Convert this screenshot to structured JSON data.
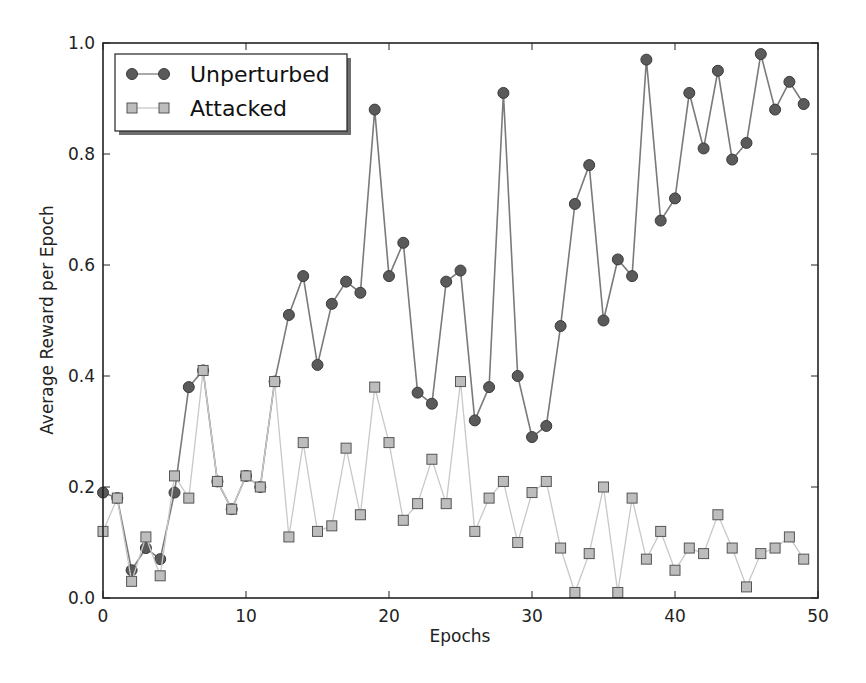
{
  "chart_data": {
    "type": "line",
    "title": "",
    "xlabel": "Epochs",
    "ylabel": "Average Reward per Epoch",
    "xlim": [
      0,
      50
    ],
    "ylim": [
      0.0,
      1.0
    ],
    "xticks": [
      "0",
      "10",
      "20",
      "30",
      "40",
      "50"
    ],
    "yticks": [
      "0.0",
      "0.2",
      "0.4",
      "0.6",
      "0.8",
      "1.0"
    ],
    "grid": false,
    "legend_position": "upper left",
    "x": [
      0,
      1,
      2,
      3,
      4,
      5,
      6,
      7,
      8,
      9,
      10,
      11,
      12,
      13,
      14,
      15,
      16,
      17,
      18,
      19,
      20,
      21,
      22,
      23,
      24,
      25,
      26,
      27,
      28,
      29,
      30,
      31,
      32,
      33,
      34,
      35,
      36,
      37,
      38,
      39,
      40,
      41,
      42,
      43,
      44,
      45,
      46,
      47,
      48,
      49
    ],
    "series": [
      {
        "name": "Unperturbed",
        "marker": "circle",
        "color": "#5a5a5a",
        "line_color": "#7a7a7a",
        "values": [
          0.19,
          0.18,
          0.05,
          0.09,
          0.07,
          0.19,
          0.38,
          0.41,
          0.21,
          0.16,
          0.22,
          0.2,
          0.39,
          0.51,
          0.58,
          0.42,
          0.53,
          0.57,
          0.55,
          0.88,
          0.58,
          0.64,
          0.37,
          0.35,
          0.57,
          0.59,
          0.32,
          0.38,
          0.91,
          0.4,
          0.29,
          0.31,
          0.49,
          0.71,
          0.78,
          0.5,
          0.61,
          0.58,
          0.97,
          0.68,
          0.72,
          0.91,
          0.81,
          0.95,
          0.79,
          0.82,
          0.98,
          0.88,
          0.93,
          0.89
        ]
      },
      {
        "name": "Attacked",
        "marker": "square",
        "color": "#bdbdbd",
        "line_color": "#c8c8c8",
        "values": [
          0.12,
          0.18,
          0.03,
          0.11,
          0.04,
          0.22,
          0.18,
          0.41,
          0.21,
          0.16,
          0.22,
          0.2,
          0.39,
          0.11,
          0.28,
          0.12,
          0.13,
          0.27,
          0.15,
          0.38,
          0.28,
          0.14,
          0.17,
          0.25,
          0.17,
          0.39,
          0.12,
          0.18,
          0.21,
          0.1,
          0.19,
          0.21,
          0.09,
          0.01,
          0.08,
          0.2,
          0.01,
          0.18,
          0.07,
          0.12,
          0.05,
          0.09,
          0.08,
          0.15,
          0.09,
          0.02,
          0.08,
          0.09,
          0.11,
          0.07
        ]
      }
    ]
  },
  "legend": {
    "items": [
      {
        "label": "Unperturbed"
      },
      {
        "label": "Attacked"
      }
    ]
  }
}
